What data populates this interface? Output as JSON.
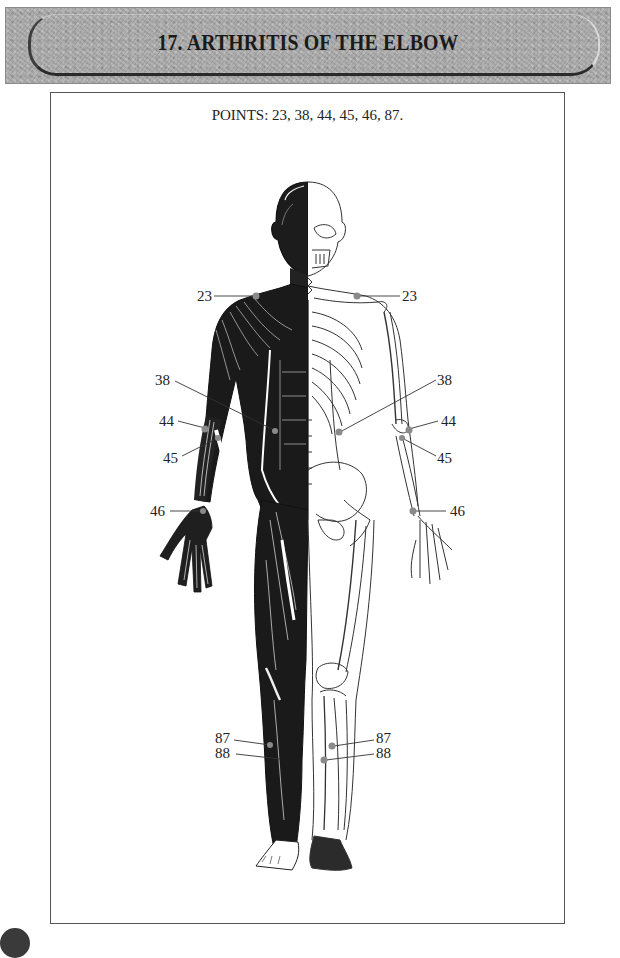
{
  "header": {
    "title": "17.  ARTHRITIS OF THE ELBOW"
  },
  "figure": {
    "caption": "POINTS: 23, 38, 44, 45, 46, 87.",
    "illustration_description": "Front view of human body, left half showing musculature, right half showing skeleton, with acupressure points marked",
    "point_color": "#8a8a8a",
    "labels": {
      "left": [
        {
          "text": "23",
          "x": 197,
          "y": 289
        },
        {
          "text": "38",
          "x": 155,
          "y": 373
        },
        {
          "text": "44",
          "x": 159,
          "y": 414
        },
        {
          "text": "45",
          "x": 163,
          "y": 451
        },
        {
          "text": "46",
          "x": 150,
          "y": 504
        },
        {
          "text": "87",
          "x": 215,
          "y": 731
        },
        {
          "text": "88",
          "x": 215,
          "y": 746
        }
      ],
      "right": [
        {
          "text": "23",
          "x": 402,
          "y": 289
        },
        {
          "text": "38",
          "x": 437,
          "y": 373
        },
        {
          "text": "44",
          "x": 441,
          "y": 414
        },
        {
          "text": "45",
          "x": 437,
          "y": 451
        },
        {
          "text": "46",
          "x": 450,
          "y": 504
        },
        {
          "text": "87",
          "x": 376,
          "y": 731
        },
        {
          "text": "88",
          "x": 376,
          "y": 746
        }
      ]
    }
  }
}
